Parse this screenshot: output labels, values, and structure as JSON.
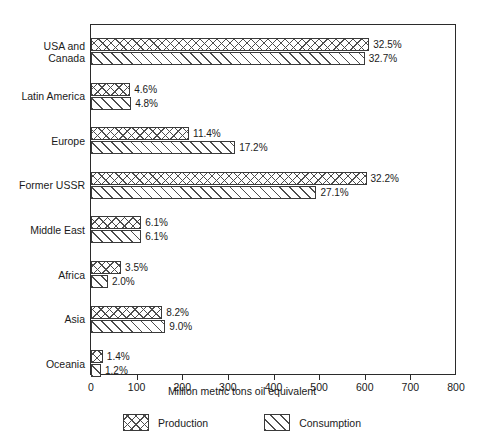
{
  "chart_data": {
    "type": "bar",
    "orientation": "horizontal",
    "title": "",
    "xlabel": "Million metric tons oil equivalent",
    "ylabel": "",
    "xlim": [
      0,
      800
    ],
    "xticks": [
      0,
      100,
      200,
      300,
      400,
      500,
      600,
      700,
      800
    ],
    "grid": false,
    "legend_position": "bottom",
    "categories": [
      "USA and\nCanada",
      "Latin America",
      "Europe",
      "Former USSR",
      "Middle East",
      "Africa",
      "Asia",
      "Oceania"
    ],
    "series": [
      {
        "name": "Production",
        "values": [
          610,
          86,
          215,
          604,
          110,
          66,
          156,
          26
        ],
        "labels": [
          "32.5%",
          "4.6%",
          "11.4%",
          "32.2%",
          "6.1%",
          "3.5%",
          "8.2%",
          "1.4%"
        ]
      },
      {
        "name": "Consumption",
        "values": [
          600,
          88,
          316,
          494,
          110,
          37,
          163,
          22
        ],
        "labels": [
          "32.7%",
          "4.8%",
          "17.2%",
          "27.1%",
          "6.1%",
          "2.0%",
          "9.0%",
          "1.2%"
        ]
      }
    ]
  },
  "axis": {
    "tick_labels": [
      "0",
      "100",
      "200",
      "300",
      "400",
      "500",
      "600",
      "700",
      "800"
    ],
    "title": "Million metric tons oil equivalent"
  },
  "legend": {
    "items": [
      {
        "label": "Production",
        "pattern": "crosshatch-swatch"
      },
      {
        "label": "Consumption",
        "pattern": "diagonal-hatch-swatch"
      }
    ]
  },
  "colors": {
    "frame": "#2b2b2b",
    "bar_outline": "#3a3a3a",
    "hatch": "#4d4d4d",
    "background": "#ffffff",
    "text": "#1a1a1a"
  }
}
